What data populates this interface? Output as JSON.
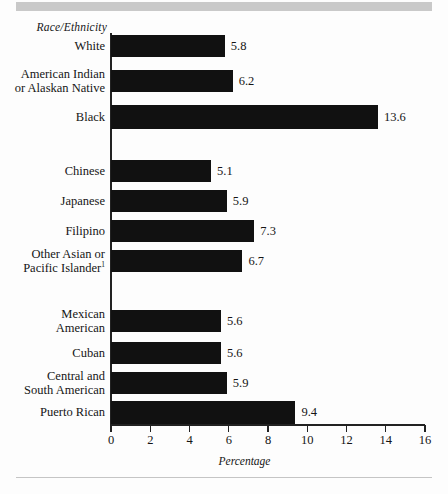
{
  "banner": {
    "present": true,
    "color": "#c9c9c9"
  },
  "chart_data": {
    "type": "bar",
    "orientation": "horizontal",
    "title": "",
    "xlabel": "Percentage",
    "ylabel": "Race/Ethnicity",
    "xlim": [
      0,
      16
    ],
    "xticks": [
      0,
      2,
      4,
      6,
      8,
      10,
      12,
      14,
      16
    ],
    "xtick_labels": [
      "0",
      "2",
      "4",
      "6",
      "8",
      "10",
      "12",
      "14",
      "16"
    ],
    "grid": false,
    "legend": false,
    "bar_color": "#111111",
    "categories": [
      "White",
      "American Indian or Alaskan Native",
      "Black",
      "Chinese",
      "Japanese",
      "Filipino",
      "Other Asian or Pacific Islander",
      "Mexican American",
      "Cuban",
      "Central and South American",
      "Puerto Rican"
    ],
    "values": [
      5.8,
      6.2,
      13.6,
      5.1,
      5.9,
      7.3,
      6.7,
      5.6,
      5.6,
      5.9,
      9.4
    ],
    "value_labels": [
      "5.8",
      "6.2",
      "13.6",
      "5.1",
      "5.9",
      "7.3",
      "6.7",
      "5.6",
      "5.6",
      "5.9",
      "9.4"
    ],
    "groups": [
      {
        "name": "group-1",
        "categories": [
          "White",
          "American Indian or Alaskan Native",
          "Black"
        ]
      },
      {
        "name": "group-2",
        "categories": [
          "Chinese",
          "Japanese",
          "Filipino",
          "Other Asian or Pacific Islander"
        ]
      },
      {
        "name": "group-3",
        "categories": [
          "Mexican American",
          "Cuban",
          "Central and South American",
          "Puerto Rican"
        ]
      }
    ]
  },
  "bars": [
    {
      "label_line1": "White",
      "label_line2": "",
      "footnote": "",
      "value": "5.8",
      "num": 5.8,
      "top": 35,
      "height": 22
    },
    {
      "label_line1": "American Indian",
      "label_line2": "or Alaskan Native",
      "footnote": "",
      "value": "6.2",
      "num": 6.2,
      "top": 70,
      "height": 22
    },
    {
      "label_line1": "Black",
      "label_line2": "",
      "footnote": "",
      "value": "13.6",
      "num": 13.6,
      "top": 105,
      "height": 24
    },
    {
      "label_line1": "Chinese",
      "label_line2": "",
      "footnote": "",
      "value": "5.1",
      "num": 5.1,
      "top": 160,
      "height": 22
    },
    {
      "label_line1": "Japanese",
      "label_line2": "",
      "footnote": "",
      "value": "5.9",
      "num": 5.9,
      "top": 190,
      "height": 22
    },
    {
      "label_line1": "Filipino",
      "label_line2": "",
      "footnote": "",
      "value": "7.3",
      "num": 7.3,
      "top": 220,
      "height": 22
    },
    {
      "label_line1": "Other Asian or",
      "label_line2": "Pacific Islander",
      "footnote": "1",
      "value": "6.7",
      "num": 6.7,
      "top": 250,
      "height": 22
    },
    {
      "label_line1": "Mexican",
      "label_line2": "American",
      "footnote": "",
      "value": "5.6",
      "num": 5.6,
      "top": 310,
      "height": 22
    },
    {
      "label_line1": "Cuban",
      "label_line2": "",
      "footnote": "",
      "value": "5.6",
      "num": 5.6,
      "top": 342,
      "height": 22
    },
    {
      "label_line1": "Central and",
      "label_line2": "South American",
      "footnote": "",
      "value": "5.9",
      "num": 5.9,
      "top": 372,
      "height": 22
    },
    {
      "label_line1": "Puerto Rican",
      "label_line2": "",
      "footnote": "",
      "value": "9.4",
      "num": 9.4,
      "top": 401,
      "height": 23
    }
  ]
}
